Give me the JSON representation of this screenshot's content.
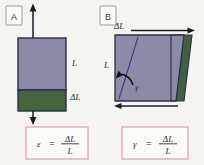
{
  "figure": {
    "background_color": "#f6f4f0",
    "panels": [
      {
        "id": "A",
        "label": "A",
        "caption_concept": "tensile-strain",
        "body_fill": "#8b8ba8",
        "delta_fill": "#46663f",
        "body_stroke": "#2d2d4a",
        "arrows": [
          {
            "name": "tension-arrow-up",
            "direction": "up",
            "color": "#1b1b22"
          },
          {
            "name": "tension-arrow-down",
            "direction": "down",
            "color": "#1b1b22"
          }
        ],
        "labels": [
          {
            "name": "length-label",
            "text": "L"
          },
          {
            "name": "delta-length-label",
            "text": "ΔL"
          }
        ],
        "formula": {
          "box_border_color": "#e79ca4",
          "box_fill": "#fdfbf8",
          "lhs": "ε",
          "equals": "=",
          "numerator": "ΔL",
          "denominator": "L"
        }
      },
      {
        "id": "B",
        "label": "B",
        "caption_concept": "shear-strain",
        "body_fill": "#8b8ba8",
        "delta_fill": "#3f6042",
        "body_stroke": "#2d2d4a",
        "arrows": [
          {
            "name": "shear-arrow-right",
            "direction": "right",
            "color": "#1b1b22"
          },
          {
            "name": "shear-arrow-left",
            "direction": "left",
            "color": "#1b1b22"
          }
        ],
        "labels": [
          {
            "name": "length-label",
            "text": "L"
          },
          {
            "name": "delta-length-label",
            "text": "ΔL"
          },
          {
            "name": "shear-angle-label",
            "text": "γ"
          }
        ],
        "formula": {
          "box_border_color": "#e79ca4",
          "box_fill": "#fdfbf8",
          "lhs": "γ",
          "equals": "=",
          "numerator": "ΔL",
          "denominator": "L"
        }
      }
    ]
  }
}
